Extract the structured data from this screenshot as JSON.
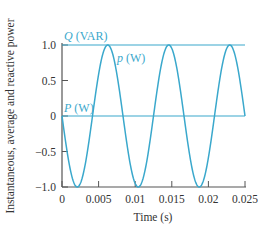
{
  "chart_data": {
    "type": "line",
    "title": "",
    "xlabel": "Time (s)",
    "ylabel": "Instantaneous, average and reactive power",
    "xlim": [
      0,
      0.025
    ],
    "ylim": [
      -1.0,
      1.0
    ],
    "grid": false,
    "x_ticks": [
      "0",
      "0.005",
      "0.01",
      "0.015",
      "0.02",
      "0.025"
    ],
    "x_tick_values": [
      0,
      0.005,
      0.01,
      0.015,
      0.02,
      0.025
    ],
    "y_ticks": [
      "1.0",
      "0.5",
      "0",
      "−0.5",
      "−1.0"
    ],
    "y_tick_values": [
      1.0,
      0.5,
      0,
      -0.5,
      -1.0
    ],
    "series": [
      {
        "name": "p (W)",
        "label_prefix": "p",
        "label_unit": " (W)",
        "description": "p(t) = -sin(2π·120·t)",
        "frequency_hz": 120,
        "amplitude": 1.0,
        "x": [
          0,
          0.00208,
          0.00417,
          0.00625,
          0.00833,
          0.01042,
          0.0125,
          0.01458,
          0.01667,
          0.01875,
          0.02083,
          0.02292,
          0.025
        ],
        "values": [
          0,
          -1.0,
          0,
          1.0,
          0,
          -1.0,
          0,
          1.0,
          0,
          -1.0,
          0,
          1.0,
          0
        ]
      },
      {
        "name": "Q (VAR)",
        "label_prefix": "Q",
        "label_unit": " (VAR)",
        "x": [
          0,
          0.025
        ],
        "values": [
          1.0,
          1.0
        ]
      },
      {
        "name": "P (W)",
        "label_prefix": "P",
        "label_unit": " (W)",
        "x": [
          0,
          0.025
        ],
        "values": [
          0,
          0
        ]
      }
    ],
    "colors": {
      "series": "#3aa8cc",
      "axis": "#555555",
      "text": "#333333"
    },
    "legend_position": "inline labels"
  }
}
